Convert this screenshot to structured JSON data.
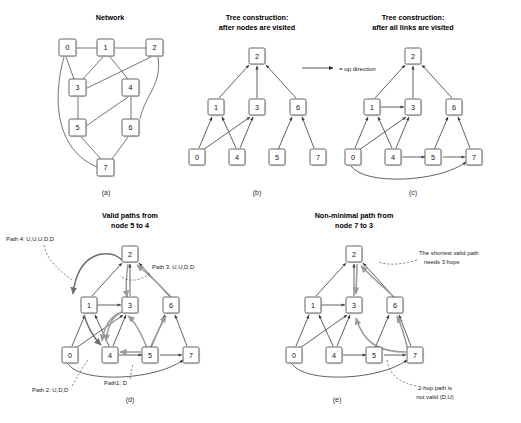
{
  "figure": {
    "caption_letters": [
      "(a)",
      "(b)",
      "(c)",
      "(d)",
      "(e)"
    ],
    "node_ids": [
      "0",
      "1",
      "2",
      "3",
      "4",
      "5",
      "6",
      "7"
    ],
    "colors": {
      "background": "#ffffff",
      "node_stroke": "#3c3c3c",
      "node_fill": "#ffffff",
      "edge": "#4a4a4a",
      "highlight_path": "#9a9a9a",
      "text": "#1a1a1a"
    }
  },
  "panel_a": {
    "title": "Network",
    "letter": "(a)",
    "nodes": [
      {
        "id": "0",
        "x": 68,
        "y": 48
      },
      {
        "id": "1",
        "x": 106,
        "y": 48
      },
      {
        "id": "2",
        "x": 155,
        "y": 48
      },
      {
        "id": "3",
        "x": 78,
        "y": 88
      },
      {
        "id": "4",
        "x": 131,
        "y": 88
      },
      {
        "id": "5",
        "x": 78,
        "y": 128
      },
      {
        "id": "6",
        "x": 131,
        "y": 128
      },
      {
        "id": "7",
        "x": 106,
        "y": 168
      }
    ],
    "edges": [
      [
        "0",
        "1"
      ],
      [
        "1",
        "2"
      ],
      [
        "0",
        "3"
      ],
      [
        "1",
        "3"
      ],
      [
        "1",
        "4"
      ],
      [
        "2",
        "3"
      ],
      [
        "2",
        "6"
      ],
      [
        "3",
        "5"
      ],
      [
        "4",
        "5"
      ],
      [
        "4",
        "6"
      ],
      [
        "0",
        "7"
      ],
      [
        "5",
        "7"
      ],
      [
        "6",
        "7"
      ]
    ]
  },
  "panel_b": {
    "title_line1": "Tree construction:",
    "title_line2": "after nodes are visited",
    "letter": "(b)",
    "levels": {
      "root": [
        "2"
      ],
      "middle": [
        "1",
        "3",
        "6"
      ],
      "leaves": [
        "0",
        "4",
        "5",
        "7"
      ]
    },
    "arrows": [
      [
        "1",
        "2"
      ],
      [
        "3",
        "2"
      ],
      [
        "6",
        "2"
      ],
      [
        "0",
        "1"
      ],
      [
        "4",
        "1"
      ],
      [
        "0",
        "3"
      ],
      [
        "4",
        "3"
      ],
      [
        "5",
        "6"
      ],
      [
        "7",
        "6"
      ]
    ],
    "legend": {
      "symbol": "arrow-right-icon",
      "text": "= up direction"
    }
  },
  "panel_c": {
    "title_line1": "Tree construction:",
    "title_line2": "after all links are visited",
    "letter": "(c)",
    "levels": {
      "root": [
        "2"
      ],
      "middle": [
        "1",
        "3",
        "6"
      ],
      "leaves": [
        "0",
        "4",
        "5",
        "7"
      ]
    },
    "tree_arrows": [
      [
        "1",
        "2"
      ],
      [
        "3",
        "2"
      ],
      [
        "6",
        "2"
      ],
      [
        "0",
        "1"
      ],
      [
        "4",
        "1"
      ],
      [
        "0",
        "3"
      ],
      [
        "4",
        "3"
      ],
      [
        "5",
        "6"
      ],
      [
        "7",
        "6"
      ]
    ],
    "cross_arrows": [
      [
        "1",
        "3"
      ],
      [
        "4",
        "5"
      ],
      [
        "5",
        "7"
      ],
      [
        "0",
        "7"
      ]
    ]
  },
  "panel_d": {
    "title_line1": "Valid paths from",
    "title_line2": "node 5 to 4",
    "letter": "(d)",
    "annotations": [
      {
        "name": "path-4-label",
        "text": "Path 4: U,U,U,D,D"
      },
      {
        "name": "path-3-label",
        "text": "Path 3: U,U,D,D"
      },
      {
        "name": "path-2-label",
        "text": "Path 2: U,D,D"
      },
      {
        "name": "path-1-label",
        "text": "Path1: D"
      }
    ],
    "paths": [
      {
        "name": "Path1",
        "sequence": "D",
        "route": [
          "5",
          "4"
        ]
      },
      {
        "name": "Path2",
        "sequence": "U,D,D",
        "route": [
          "5",
          "3",
          "4"
        ]
      },
      {
        "name": "Path3",
        "sequence": "U,U,D,D",
        "route": [
          "5",
          "6",
          "2",
          "3",
          "4"
        ]
      },
      {
        "name": "Path4",
        "sequence": "U,U,U,D,D",
        "route": [
          "5",
          "6",
          "2",
          "1",
          "4"
        ]
      }
    ]
  },
  "panel_e": {
    "title_line1": "Non-minimal path from",
    "title_line2": "node 7 to 3",
    "letter": "(e)",
    "annotations": [
      {
        "name": "shortest-path-note",
        "line1": "The shortest valid path",
        "line2": "needs 3 hops"
      },
      {
        "name": "invalid-path-note",
        "line1": "2-hop path is",
        "line2": "not valid (D,U)"
      }
    ],
    "valid_route": [
      "7",
      "6",
      "2",
      "3"
    ],
    "invalid_route": [
      "7",
      "5",
      "3"
    ]
  }
}
